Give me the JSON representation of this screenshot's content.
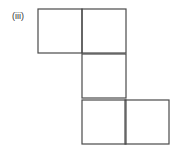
{
  "figure": {
    "label": "(iii)",
    "line_color": "#4a4a4a",
    "squares": [
      {
        "row": 0,
        "col": 0,
        "x": 38,
        "y": 9,
        "size": 44
      },
      {
        "row": 0,
        "col": 1,
        "x": 82,
        "y": 9,
        "size": 44
      },
      {
        "row": 1,
        "col": 1,
        "x": 82,
        "y": 54,
        "size": 44
      },
      {
        "row": 2,
        "col": 1,
        "x": 82,
        "y": 100,
        "size": 44
      },
      {
        "row": 2,
        "col": 2,
        "x": 125,
        "y": 100,
        "size": 44
      }
    ]
  }
}
